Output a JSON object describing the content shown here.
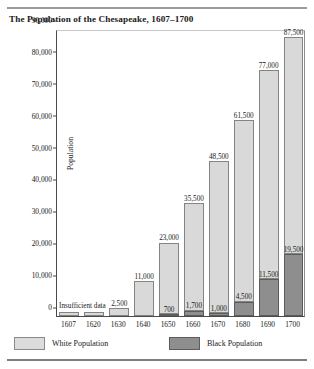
{
  "chart_data": {
    "type": "bar",
    "subtype": "stacked-bar",
    "title": "The Population of the Chesapeake, 1607–1700",
    "xlabel": "",
    "ylabel": "Population",
    "ylim": [
      0,
      90000
    ],
    "ytick_labels": [
      "0",
      "10,000",
      "20,000",
      "30,000",
      "40,000",
      "50,000",
      "60,000",
      "70,000",
      "80,000",
      "90,000"
    ],
    "ytick_values": [
      0,
      10000,
      20000,
      30000,
      40000,
      50000,
      60000,
      70000,
      80000,
      90000
    ],
    "grid": false,
    "legend_position": "bottom-left",
    "categories": [
      "1607",
      "1620",
      "1630",
      "1640",
      "1650",
      "1660",
      "1670",
      "1680",
      "1690",
      "1700"
    ],
    "series": [
      {
        "name": "Black Population",
        "color": "#8e8e8e",
        "values": [
          null,
          null,
          null,
          null,
          700,
          1700,
          1000,
          4500,
          11500,
          19500
        ],
        "labels": [
          "",
          "",
          "",
          "",
          "700",
          "1,700",
          "1,000",
          "4,500",
          "11,500",
          "19,500"
        ]
      },
      {
        "name": "White Population",
        "color": "#d9d9d9",
        "values": [
          null,
          null,
          2500,
          11000,
          23000,
          35500,
          48500,
          61500,
          77000,
          87500
        ],
        "labels": [
          "",
          "",
          "2,500",
          "11,000",
          "23,000",
          "35,500",
          "48,500",
          "61,500",
          "77,000",
          "87,500"
        ]
      }
    ],
    "annotations": [
      {
        "text": "Insufficient data",
        "categories": [
          "1607",
          "1620"
        ]
      }
    ]
  },
  "legend": {
    "items": [
      {
        "label": "White Population",
        "swatch": "white"
      },
      {
        "label": "Black Population",
        "swatch": "black"
      }
    ]
  }
}
